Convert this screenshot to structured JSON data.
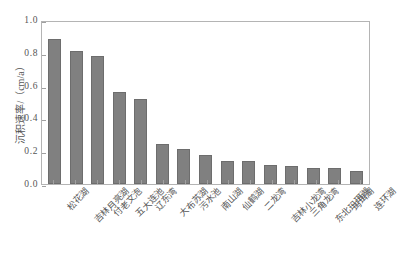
{
  "chart_data": {
    "type": "bar",
    "title": "",
    "xlabel": "",
    "ylabel": "沉积速率/（cm/a）",
    "ylim": [
      0.0,
      1.0
    ],
    "yticks": [
      "1.0",
      "0.8",
      "0.6",
      "0.4",
      "0.2",
      "0.0"
    ],
    "ytick_values": [
      1.0,
      0.8,
      0.6,
      0.4,
      0.2,
      0.0
    ],
    "grid": false,
    "legend": null,
    "bar_color": "#808080",
    "categories": [
      "松花湖",
      "吉林月亮湖",
      "付老文泡",
      "五大连池",
      "辽东湾",
      "大布苏湖",
      "污水池",
      "南山湖",
      "仙鹤湖",
      "二龙湾",
      "吉林小龙湾",
      "三角龙湾",
      "东北玛珥湖",
      "玛珥湖",
      "连环湖"
    ],
    "values": [
      0.895,
      0.82,
      0.79,
      0.57,
      0.525,
      0.245,
      0.215,
      0.18,
      0.145,
      0.14,
      0.115,
      0.11,
      0.1,
      0.1,
      0.08
    ]
  }
}
